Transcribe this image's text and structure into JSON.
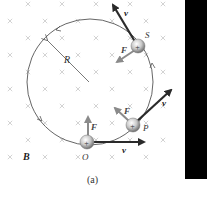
{
  "figure": {
    "caption": "(a)",
    "field_label": "B",
    "radius_label": "R",
    "colors": {
      "circle": "#555555",
      "velocity_arrow": "#2a2a2a",
      "force_arrow": "#8a8a8a",
      "x_mark": "#c8c8c8",
      "particle_fill": "#bdbdbd",
      "panel": "#000000"
    },
    "particles": [
      {
        "name": "S",
        "position_label": "S",
        "charge_symbol": "+",
        "velocity_label": "v",
        "force_label": "F"
      },
      {
        "name": "P",
        "position_label": "P",
        "charge_symbol": "+",
        "velocity_label": "v",
        "force_label": "F"
      },
      {
        "name": "O",
        "position_label": "O",
        "charge_symbol": "+",
        "velocity_label": "v",
        "force_label": "F"
      }
    ]
  }
}
